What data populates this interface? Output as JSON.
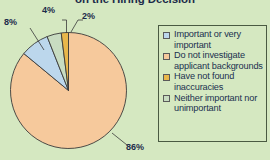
{
  "chart_data": {
    "type": "pie",
    "title": "on the Hiring Decision",
    "categories": [
      "Do not investigate applicant backgrounds",
      "Important or very important",
      "Neither important nor unimportant",
      "Have not found inaccuracies"
    ],
    "values": [
      86,
      8,
      4,
      2
    ],
    "value_labels": [
      "86%",
      "8%",
      "4%",
      "2%"
    ],
    "colors": [
      "#f6c99c",
      "#bcd7ec",
      "#c8dcc1",
      "#e9b74b"
    ],
    "legend_position": "right",
    "grid": false,
    "xlabel": "",
    "ylabel": ""
  },
  "title": {
    "text": "on the Hiring Decision"
  },
  "labels": {
    "slice_86": "86%",
    "slice_8": "8%",
    "slice_4": "4%",
    "slice_2": "2%"
  },
  "legend": {
    "items": [
      {
        "label": "Important or very important",
        "color": "#bcd7ec"
      },
      {
        "label": "Do not investigate applicant backgrounds",
        "color": "#f6c99c"
      },
      {
        "label": "Have not found inaccuracies",
        "color": "#e9b74b"
      },
      {
        "label": "Neither important nor unimportant",
        "color": "#c8dcc1"
      }
    ]
  },
  "theme": {
    "background": "#d5e8c1",
    "text": "#20304f",
    "outline": "#4a5a42"
  }
}
